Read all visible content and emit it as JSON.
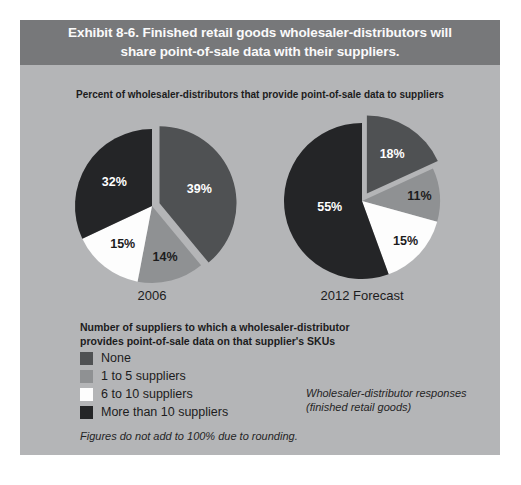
{
  "header": {
    "title_line1": "Exhibit 8-6. Finished retail goods wholesaler-distributors will",
    "title_line2": "share point-of-sale data with their suppliers."
  },
  "chart_data": {
    "type": "pie",
    "title": "Percent of wholesaler-distributors that provide point-of-sale data to suppliers",
    "legend_title_line1": "Number of suppliers to which a wholesaler-distributor",
    "legend_title_line2": "provides point-of-sale data on that supplier's SKUs",
    "legend_position": "bottom-left",
    "categories": [
      "None",
      "1 to 5 suppliers",
      "6 to 10 suppliers",
      "More than 10 suppliers"
    ],
    "colors": [
      "#4f5153",
      "#8f9193",
      "#fdfdfd",
      "#242527"
    ],
    "label_colors": [
      "#ffffff",
      "#1c1c1d",
      "#1c1c1d",
      "#ffffff"
    ],
    "pies": [
      {
        "label": "2006",
        "values": [
          39,
          14,
          15,
          32
        ],
        "value_labels": [
          "39%",
          "14%",
          "15%",
          "32%"
        ],
        "exploded_index": 0,
        "label_radius": [
          0.55,
          0.68,
          0.62,
          0.58
        ]
      },
      {
        "label": "2012 Forecast",
        "values": [
          18,
          11,
          15,
          55
        ],
        "value_labels": [
          "18%",
          "11%",
          "15%",
          "55%"
        ],
        "exploded_index": 0,
        "label_radius": [
          0.6,
          0.74,
          0.76,
          0.42
        ]
      }
    ],
    "source_note_line1": "Wholesaler-distributor responses",
    "source_note_line2": "(finished retail goods)",
    "footnote": "Figures do not add to 100% due to rounding."
  },
  "style": {
    "page_bg": "#ffffff",
    "panel_bg": "#b4b5b7",
    "header_bg": "#77787a",
    "header_text": "#fafafa",
    "text_dark": "#1c1c1d"
  }
}
